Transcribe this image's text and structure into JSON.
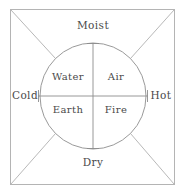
{
  "diagram": {
    "type": "classical-elements-wheel",
    "colors": {
      "background": "#ffffff",
      "stroke": "#9a9a9a",
      "border": "#b0b0b0",
      "text": "#4a4a4a"
    },
    "outer_labels": {
      "top": "Moist",
      "left": "Cold",
      "right": "Hot",
      "bottom": "Dry"
    },
    "quadrant_labels": {
      "top_left": "Water",
      "top_right": "Air",
      "bottom_left": "Earth",
      "bottom_right": "Fire"
    },
    "geometry": {
      "square": {
        "x": 10,
        "y": 9,
        "width": 165,
        "height": 176
      },
      "circle": {
        "cx": 93,
        "cy": 96,
        "r": 53
      },
      "horizontal_axis": {
        "x1": 38,
        "x2": 148,
        "y": 96
      },
      "vertical_axis": {
        "y1": 43,
        "y2": 149,
        "x": 93
      }
    }
  }
}
